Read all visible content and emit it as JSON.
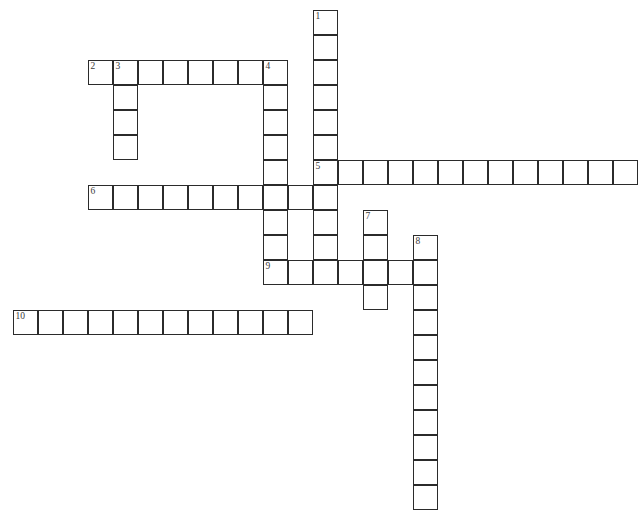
{
  "document": {
    "type": "crossword-puzzle-grid",
    "title": "Crossword Puzzle",
    "background_color": "#ffffff",
    "cell_border_color": "#2b2b2b",
    "cell_fill_color": "#ffffff",
    "number_color": "#3a3a3a",
    "cell_size_px": 25,
    "origin": {
      "x": 13,
      "y": 10
    },
    "grid_columns": 25,
    "grid_rows": 19
  },
  "entries": [
    {
      "number": "1",
      "direction": "down",
      "start_col": 12,
      "start_row": 0,
      "length": 11,
      "label": "1-down"
    },
    {
      "number": "2",
      "direction": "across",
      "start_col": 3,
      "start_row": 2,
      "length": 8,
      "label": "2-across"
    },
    {
      "number": "3",
      "direction": "down",
      "start_col": 4,
      "start_row": 2,
      "length": 4,
      "label": "3-down"
    },
    {
      "number": "4",
      "direction": "down",
      "start_col": 10,
      "start_row": 2,
      "length": 9,
      "label": "4-down"
    },
    {
      "number": "5",
      "direction": "across",
      "start_col": 12,
      "start_row": 6,
      "length": 13,
      "label": "5-across"
    },
    {
      "number": "6",
      "direction": "across",
      "start_col": 3,
      "start_row": 7,
      "length": 9,
      "label": "6-across"
    },
    {
      "number": "7",
      "direction": "down",
      "start_col": 14,
      "start_row": 8,
      "length": 4,
      "label": "7-down"
    },
    {
      "number": "8",
      "direction": "down",
      "start_col": 16,
      "start_row": 9,
      "length": 11,
      "label": "8-down"
    },
    {
      "number": "9",
      "direction": "across",
      "start_col": 10,
      "start_row": 10,
      "length": 7,
      "label": "9-across"
    },
    {
      "number": "10",
      "direction": "across",
      "start_col": 0,
      "start_row": 12,
      "length": 12,
      "label": "10-across"
    }
  ],
  "numbered_cells": [
    {
      "number": "1",
      "col": 12,
      "row": 0
    },
    {
      "number": "2",
      "col": 3,
      "row": 2
    },
    {
      "number": "3",
      "col": 4,
      "row": 2
    },
    {
      "number": "4",
      "col": 10,
      "row": 2
    },
    {
      "number": "5",
      "col": 12,
      "row": 6
    },
    {
      "number": "6",
      "col": 3,
      "row": 7
    },
    {
      "number": "7",
      "col": 14,
      "row": 8
    },
    {
      "number": "8",
      "col": 16,
      "row": 9
    },
    {
      "number": "9",
      "col": 10,
      "row": 10
    },
    {
      "number": "10",
      "col": 0,
      "row": 12
    }
  ]
}
